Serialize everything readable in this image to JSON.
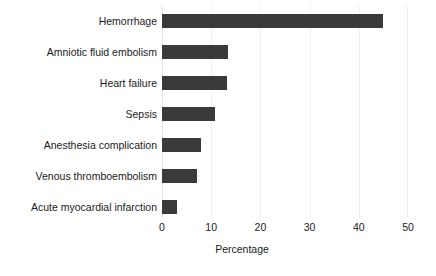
{
  "chart_data": {
    "type": "bar",
    "orientation": "horizontal",
    "title": "",
    "xlabel": "Percentage",
    "ylabel": "",
    "xlim": [
      0,
      50
    ],
    "xticks": [
      0,
      10,
      20,
      30,
      40,
      50
    ],
    "grid": true,
    "legend": null,
    "categories": [
      "Hemorrhage",
      "Amniotic fluid embolism",
      "Heart failure",
      "Sepsis",
      "Anesthesia complication",
      "Venous thromboembolism",
      "Acute myocardial infarction"
    ],
    "values": [
      45,
      13.4,
      13.2,
      10.8,
      7.9,
      7.1,
      3.0
    ],
    "series": [
      {
        "name": "Percentage",
        "values": [
          45,
          13.4,
          13.2,
          10.8,
          7.9,
          7.1,
          3.0
        ]
      }
    ],
    "bar_color": "#3a3a3a",
    "grid_color": "#eeeeee"
  }
}
